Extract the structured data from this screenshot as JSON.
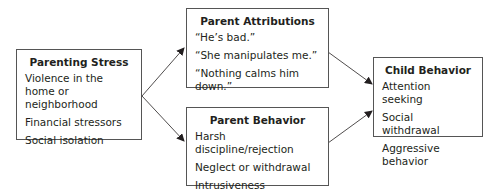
{
  "boxes": {
    "parenting_stress": {
      "title": "Parenting Stress",
      "items": [
        "Violence in the home or neighborhood",
        "Financial stressors",
        "Social isolation"
      ]
    },
    "parent_attributions": {
      "title": "Parent Attributions",
      "items": [
        "“He’s bad.”",
        "“She manipulates me.”",
        "“Nothing calms him down.”"
      ]
    },
    "parent_behavior": {
      "title": "Parent Behavior",
      "items": [
        "Harsh discipline/rejection",
        "Neglect or withdrawal",
        "Intrusiveness"
      ]
    },
    "child_behavior": {
      "title": "Child Behavior",
      "items": [
        "Attention seeking",
        "Social withdrawal",
        "Aggressive behavior"
      ]
    }
  },
  "edges": [
    {
      "from": "Parenting Stress",
      "to": "Parent Attributions"
    },
    {
      "from": "Parenting Stress",
      "to": "Parent Behavior"
    },
    {
      "from": "Parent Attributions",
      "to": "Child Behavior"
    },
    {
      "from": "Parent Behavior",
      "to": "Child Behavior"
    }
  ]
}
